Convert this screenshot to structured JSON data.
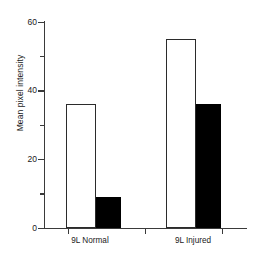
{
  "chart_data": {
    "type": "bar",
    "title": "",
    "subtitle": "",
    "xlabel": "",
    "ylabel": "Mean pixel intensity",
    "categories": [
      "9L Normal",
      "9L Injured"
    ],
    "series": [
      {
        "name": "open",
        "values": [
          36,
          55
        ]
      },
      {
        "name": "filled",
        "values": [
          9,
          36
        ]
      }
    ],
    "ylim": [
      0,
      60
    ],
    "yticks": [
      0,
      20,
      40,
      60
    ],
    "ytick_labels": [
      "0",
      "20",
      "40",
      "60"
    ],
    "yminor_ticks": [
      10,
      30,
      50
    ],
    "grid": false,
    "legend": "none",
    "annotations": []
  },
  "axis": {
    "y_label": "Mean pixel intensity",
    "tick_0": "0",
    "tick_20": "20",
    "tick_40": "40",
    "tick_60": "60"
  },
  "categories": {
    "group1": "9L Normal",
    "group2": "9L Injured"
  },
  "colors": {
    "open_bar_fill": "#ffffff",
    "open_bar_edge": "#2b2b2b",
    "filled_bar": "#000000",
    "axis": "#3a3a3a",
    "background": "#ffffff",
    "text": "#1a1a1a"
  }
}
